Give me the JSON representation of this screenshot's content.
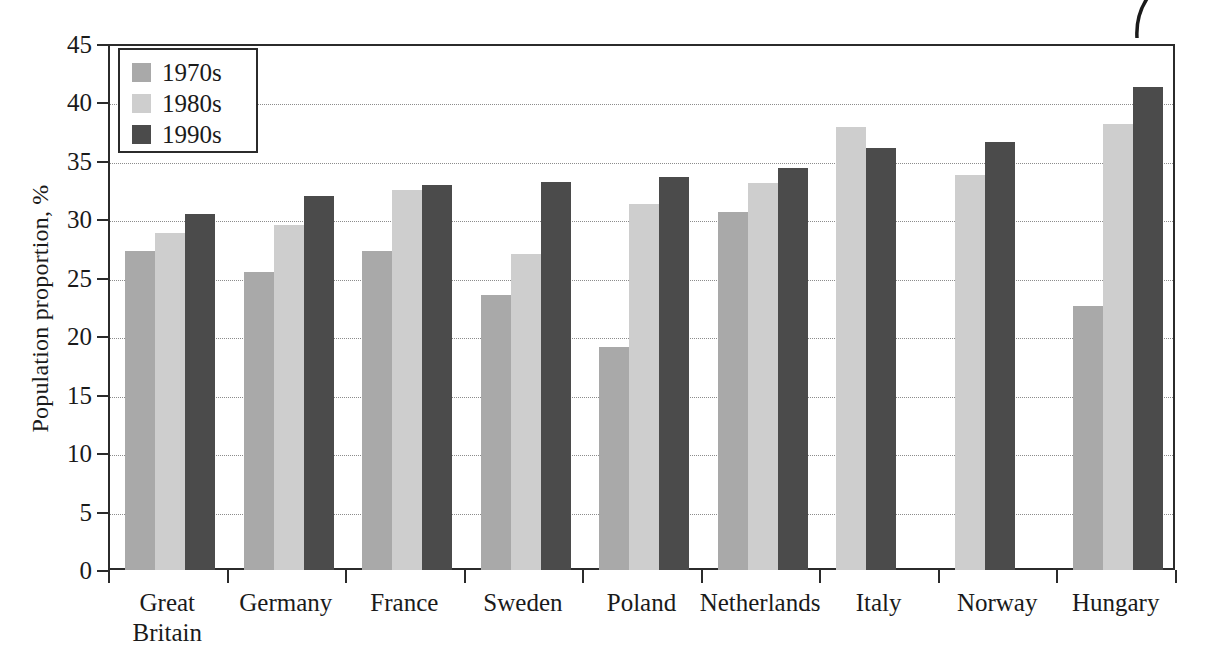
{
  "chart_data": {
    "type": "bar",
    "title": "",
    "xlabel": "",
    "ylabel": "Population proportion, %",
    "ylim": [
      0,
      45
    ],
    "yticks": [
      "0",
      "5",
      "10",
      "15",
      "20",
      "25",
      "30",
      "35",
      "40",
      "45"
    ],
    "grid": true,
    "legend_position": "top-left",
    "categories": [
      "Great\nBritain",
      "Germany",
      "France",
      "Sweden",
      "Poland",
      "Netherlands",
      "Italy",
      "Norway",
      "Hungary"
    ],
    "category_labels": [
      [
        "Great",
        "Britain"
      ],
      [
        "Germany"
      ],
      [
        "France"
      ],
      [
        "Sweden"
      ],
      [
        "Poland"
      ],
      [
        "Netherlands"
      ],
      [
        "Italy"
      ],
      [
        "Norway"
      ],
      [
        "Hungary"
      ]
    ],
    "series": [
      {
        "name": "1970s",
        "color": "#a9a9a9",
        "values": [
          27.3,
          25.5,
          27.3,
          23.5,
          19.1,
          30.6,
          null,
          null,
          22.6
        ]
      },
      {
        "name": "1980s",
        "color": "#cecece",
        "values": [
          28.8,
          29.5,
          32.5,
          27.0,
          31.3,
          33.1,
          37.9,
          33.8,
          38.2
        ]
      },
      {
        "name": "1990s",
        "color": "#4b4b4b",
        "values": [
          30.5,
          32.0,
          32.9,
          33.2,
          33.6,
          34.4,
          36.1,
          36.6,
          41.3
        ]
      }
    ]
  },
  "legend": {
    "entries": [
      {
        "label": "1970s",
        "color": "#a9a9a9"
      },
      {
        "label": "1980s",
        "color": "#cecece"
      },
      {
        "label": "1990s",
        "color": "#4b4b4b"
      }
    ]
  },
  "colors": {
    "axis": "#2b2b2b",
    "grid": "#8c8c8c",
    "background": "#ffffff",
    "series_1970s": "#a9a9a9",
    "series_1980s": "#cecece",
    "series_1990s": "#4b4b4b"
  }
}
